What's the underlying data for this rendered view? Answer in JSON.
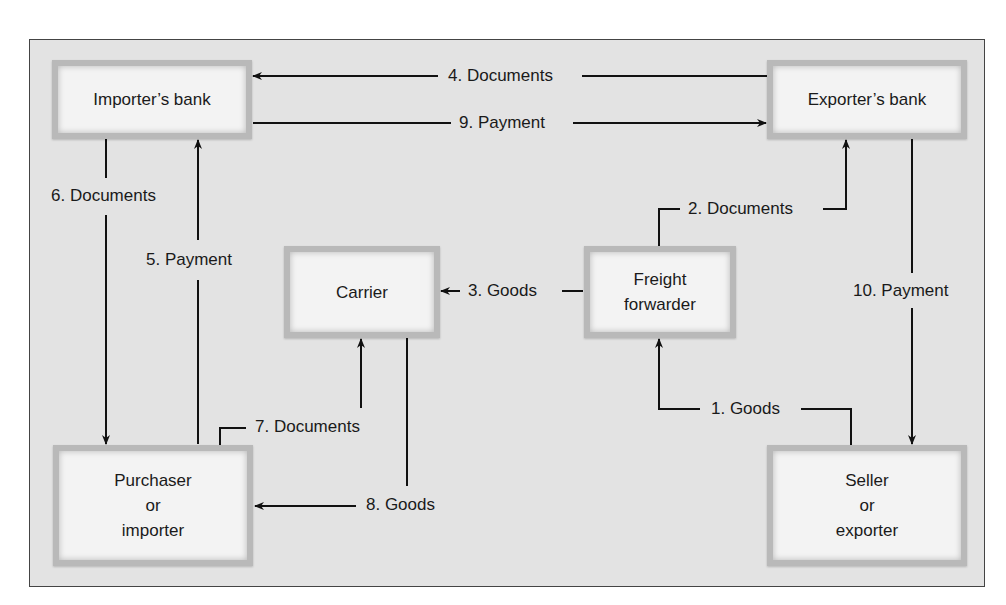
{
  "diagram": {
    "type": "flowchart",
    "title": "",
    "nodes": {
      "importers_bank": {
        "label": "Importer’s bank"
      },
      "exporters_bank": {
        "label": "Exporter’s bank"
      },
      "carrier": {
        "label": "Carrier"
      },
      "freight_forwarder": {
        "lines": [
          "Freight",
          "forwarder"
        ]
      },
      "purchaser": {
        "lines": [
          "Purchaser",
          "or",
          "importer"
        ]
      },
      "seller": {
        "lines": [
          "Seller",
          "or",
          "exporter"
        ]
      }
    },
    "edges": [
      {
        "step": 1,
        "label": "1. Goods",
        "from": "Seller or exporter",
        "to": "Freight forwarder"
      },
      {
        "step": 2,
        "label": "2. Documents",
        "from": "Freight forwarder",
        "to": "Exporter’s bank"
      },
      {
        "step": 3,
        "label": "3. Goods",
        "from": "Freight forwarder",
        "to": "Carrier"
      },
      {
        "step": 4,
        "label": "4. Documents",
        "from": "Exporter’s bank",
        "to": "Importer’s bank"
      },
      {
        "step": 5,
        "label": "5. Payment",
        "from": "Purchaser or importer",
        "to": "Importer’s bank"
      },
      {
        "step": 6,
        "label": "6. Documents",
        "from": "Importer’s bank",
        "to": "Purchaser or importer"
      },
      {
        "step": 7,
        "label": "7. Documents",
        "from": "Purchaser or importer",
        "to": "Carrier"
      },
      {
        "step": 8,
        "label": "8. Goods",
        "from": "Carrier",
        "to": "Purchaser or importer"
      },
      {
        "step": 9,
        "label": "9. Payment",
        "from": "Importer’s bank",
        "to": "Exporter’s bank"
      },
      {
        "step": 10,
        "label": "10. Payment",
        "from": "Exporter’s bank",
        "to": "Seller or exporter"
      }
    ]
  },
  "colors": {
    "frame_bg": "#e3e3e3",
    "box_bg": "#f3f3f3",
    "box_border": "#b9b9b9",
    "line": "#111111"
  }
}
